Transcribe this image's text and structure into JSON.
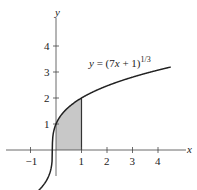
{
  "chart_data": {
    "type": "line",
    "title": "",
    "equation_label": "y = (7x + 1)^(1/3)",
    "equation_parts": {
      "prefix": "y = (7",
      "x": "x",
      "mid": " + 1)",
      "exp": "1/3"
    },
    "xlabel": "x",
    "ylabel": "y",
    "xlim": [
      -1.6,
      5.1
    ],
    "ylim": [
      -1.1,
      5.5
    ],
    "x_ticks": [
      -1,
      1,
      2,
      3,
      4
    ],
    "x_tick_labels": [
      "−1",
      "1",
      "2",
      "3",
      "4"
    ],
    "y_ticks": [
      1,
      2,
      3,
      4
    ],
    "y_tick_labels": [
      "1",
      "2",
      "3",
      "4"
    ],
    "series": [
      {
        "name": "y = (7x+1)^(1/3)",
        "function": "cbrt(7x+1)",
        "x_range": [
          -1.3,
          4.5
        ]
      }
    ],
    "shaded_region": {
      "x_from": 0,
      "x_to": 1,
      "description": "area under curve from x=0 to x=1"
    },
    "grid": false,
    "legend": "none"
  }
}
